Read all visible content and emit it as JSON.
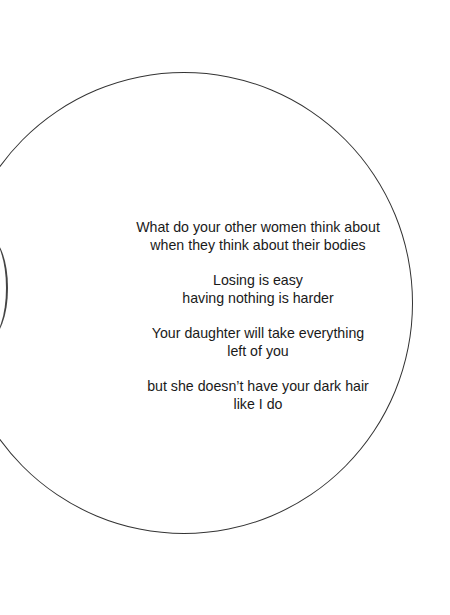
{
  "poem": {
    "stanzas": [
      [
        "What do your other women think about",
        "when they think about their bodies"
      ],
      [
        "Losing is easy",
        "having nothing is harder"
      ],
      [
        "Your daughter will take everything",
        "left of you"
      ],
      [
        "but she doesn’t have your dark hair",
        "like I do"
      ]
    ]
  }
}
